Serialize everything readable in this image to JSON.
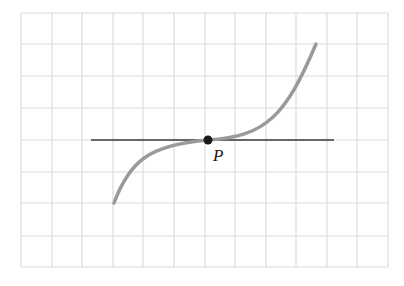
{
  "figure": {
    "grid": {
      "x_lines": [
        21,
        52,
        82,
        113,
        143,
        174,
        205,
        235,
        266,
        296,
        327,
        357,
        388
      ],
      "y_lines": [
        13,
        44,
        76,
        108,
        140,
        172,
        203,
        236,
        267
      ],
      "color": "#dcdcdc"
    },
    "tangent_line": {
      "x1": 91,
      "y1": 140,
      "x2": 334,
      "y2": 140,
      "color": "#3a3a3a"
    },
    "curve": {
      "color": "#9a9a9a",
      "path": "M114,203 C130,160 150,145 208,140 C266,137 286,115 316,44"
    },
    "point": {
      "name": "P",
      "cx": 208,
      "cy": 140,
      "r": 4.5,
      "color": "#1a1a1a"
    },
    "point_label": {
      "text": "P",
      "x": 213,
      "y": 161
    }
  }
}
